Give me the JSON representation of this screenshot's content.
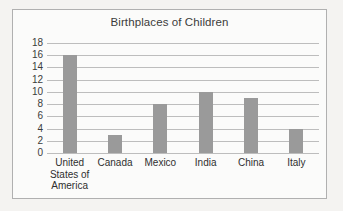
{
  "chart_data": {
    "type": "bar",
    "title": "Birthplaces of Children",
    "xlabel": "",
    "ylabel": "",
    "categories": [
      "United\nStates of\nAmerica",
      "Canada",
      "Mexico",
      "India",
      "China",
      "Italy"
    ],
    "values": [
      16,
      3,
      8,
      10,
      9,
      4
    ],
    "ylim": [
      0,
      18
    ],
    "ytick_step": 2,
    "yticks": [
      18,
      16,
      14,
      12,
      10,
      8,
      6,
      4,
      2,
      0
    ],
    "grid": true,
    "legend": "none",
    "bar_color": "#9a9a9a",
    "gridline_color": "#bdbdbd",
    "frame_color": "#b0b0b0",
    "text_color": "#3b3b3b",
    "background_color": "#fbfbfa"
  }
}
